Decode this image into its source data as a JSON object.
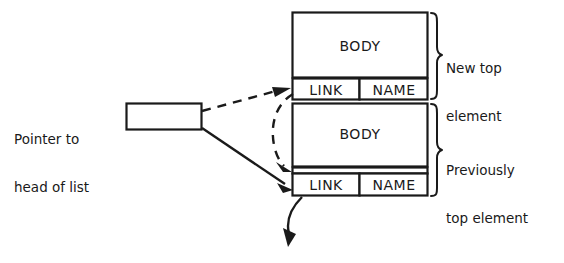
{
  "diagram": {
    "stroke_color": "#1a1a1a",
    "background_color": "#ffffff",
    "pointer": {
      "caption_line1": "Pointer to",
      "caption_line2": "head of list",
      "box_value": ""
    },
    "elements": [
      {
        "id": "new-top",
        "body_label": "BODY",
        "link_label": "LINK",
        "name_label": "NAME",
        "bracket_caption_line1": "New top",
        "bracket_caption_line2": "element"
      },
      {
        "id": "previously-top",
        "body_label": "BODY",
        "link_label": "LINK",
        "name_label": "NAME",
        "bracket_caption_line1": "Previously",
        "bracket_caption_line2": "top element"
      }
    ],
    "connectors": [
      {
        "id": "dashed-pointer-to-new-link",
        "style": "dashed",
        "arrowhead": true
      },
      {
        "id": "dashed-newlink-to-prev-element",
        "style": "dashed",
        "arrowhead": true
      },
      {
        "id": "solid-pointer-to-prev-link",
        "style": "solid",
        "arrowhead": true
      },
      {
        "id": "solid-prevlink-to-rest-of-list",
        "style": "solid",
        "arrowhead": true
      }
    ]
  }
}
